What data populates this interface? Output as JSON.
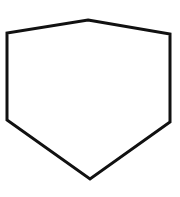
{
  "figure": {
    "shape": "hexagon",
    "stroke_color": "#111111",
    "fill_color": "#ffffff",
    "stroke_width": 3,
    "vertices": [
      {
        "x": 88,
        "y": 20
      },
      {
        "x": 170,
        "y": 34
      },
      {
        "x": 170,
        "y": 122
      },
      {
        "x": 90,
        "y": 179
      },
      {
        "x": 7,
        "y": 120
      },
      {
        "x": 7,
        "y": 33
      }
    ]
  }
}
